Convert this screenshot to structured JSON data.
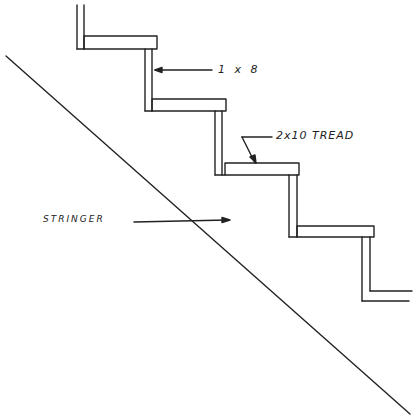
{
  "diagram": {
    "type": "stair-construction-sketch",
    "labels": {
      "riser": "1 x 8",
      "tread": "2x10 TREAD",
      "stringer": "STRINGER"
    },
    "colors": {
      "ink": "#222222",
      "background": "#ffffff"
    },
    "steps_visible": 4
  }
}
